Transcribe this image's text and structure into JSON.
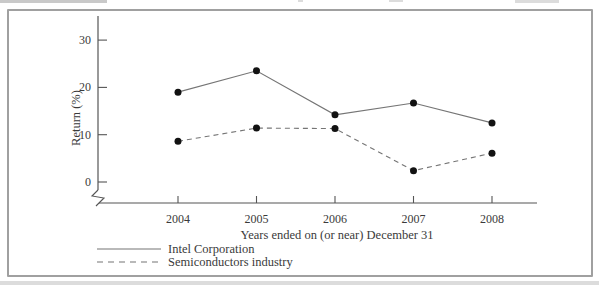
{
  "chart_data": {
    "type": "line",
    "title": "",
    "xlabel": "Years ended on (or near) December 31",
    "ylabel": "Return (%)",
    "categories": [
      "2004",
      "2005",
      "2006",
      "2007",
      "2008"
    ],
    "series": [
      {
        "name": "Intel Corporation",
        "style": "solid",
        "values": [
          19.0,
          23.5,
          14.2,
          16.7,
          12.5
        ]
      },
      {
        "name": "Semiconductors industry",
        "style": "dashed",
        "values": [
          8.6,
          11.4,
          11.3,
          2.4,
          6.1
        ]
      }
    ],
    "y_ticks": [
      0,
      10,
      20,
      30
    ],
    "ylim": [
      0,
      33
    ],
    "axis_break_at_origin": true,
    "grid": false,
    "legend_position": "bottom-left",
    "marker": "filled-circle"
  },
  "colors": {
    "background": "#ffffff",
    "frame_border": "#a0a0a0",
    "axis": "#555555",
    "line": "#757575",
    "point": "#121212",
    "text": "#3a3a3a"
  }
}
